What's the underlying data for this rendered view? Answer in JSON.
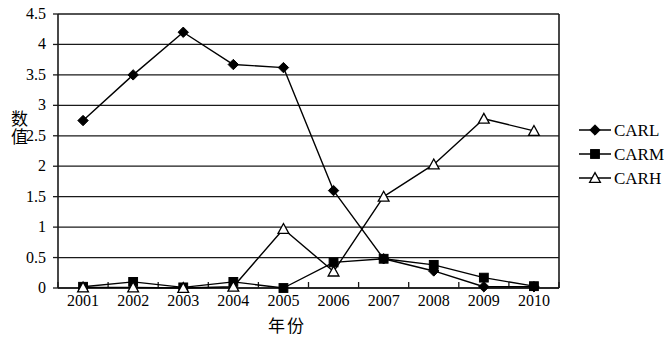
{
  "chart_data": {
    "type": "line",
    "title": "",
    "xlabel": "年份",
    "ylabel": "数值",
    "categories": [
      "2001",
      "2002",
      "2003",
      "2004",
      "2005",
      "2006",
      "2007",
      "2008",
      "2009",
      "2010"
    ],
    "x": [
      2001,
      2002,
      2003,
      2004,
      2005,
      2006,
      2007,
      2008,
      2009,
      2010
    ],
    "ylim": [
      0,
      4.5
    ],
    "ytick_labels": [
      "0",
      "0.5",
      "1",
      "1.5",
      "2",
      "2.5",
      "3",
      "3.5",
      "4",
      "4.5"
    ],
    "ytick_values": [
      0,
      0.5,
      1,
      1.5,
      2,
      2.5,
      3,
      3.5,
      4,
      4.5
    ],
    "grid": "horizontal",
    "legend_position": "right",
    "series": [
      {
        "name": "CARL",
        "marker": "filled-diamond",
        "color": "#000000",
        "values": [
          2.75,
          3.5,
          4.2,
          3.67,
          3.62,
          1.6,
          0.48,
          0.28,
          0.02,
          0.02
        ]
      },
      {
        "name": "CARM",
        "marker": "filled-square",
        "color": "#000000",
        "values": [
          0.02,
          0.1,
          0.01,
          0.1,
          0.0,
          0.42,
          0.48,
          0.38,
          0.17,
          0.03
        ]
      },
      {
        "name": "CARH",
        "marker": "open-triangle",
        "color": "#000000",
        "values": [
          0.01,
          0.01,
          0.0,
          0.02,
          0.97,
          0.27,
          1.5,
          2.03,
          2.78,
          2.58
        ]
      }
    ]
  },
  "legend": {
    "items": [
      {
        "label": "CARL",
        "marker": "filled-diamond"
      },
      {
        "label": "CARM",
        "marker": "filled-square"
      },
      {
        "label": "CARH",
        "marker": "open-triangle"
      }
    ]
  }
}
